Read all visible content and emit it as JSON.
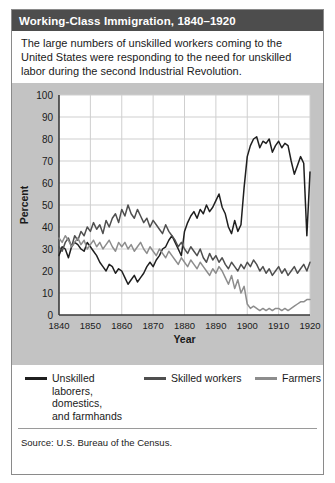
{
  "figure": {
    "title": "Working-Class Immigration, 1840–1920",
    "caption": "The large numbers of unskilled workers coming to the United States were responding to the need for unskilled labor during the second Industrial Revolution.",
    "source": "Source: U.S. Bureau of the Census."
  },
  "colors": {
    "title_bar": "#4d4d4d",
    "title_text": "#ffffff",
    "panel_background": "#c3c3c3",
    "plot_background": "#ffffff",
    "gridline": "#cfcfcf",
    "axis": "#3a3a3a",
    "series_unskilled": "#1f1f1f",
    "series_skilled": "#4f4f4f",
    "series_farmers": "#8d8d8d"
  },
  "chart_data": {
    "type": "line",
    "title": "",
    "xlabel": "Year",
    "ylabel": "Percent",
    "xlim": [
      1840,
      1920
    ],
    "ylim": [
      0,
      100
    ],
    "xticks": [
      1840,
      1850,
      1860,
      1870,
      1880,
      1890,
      1900,
      1910,
      1920
    ],
    "yticks": [
      0,
      10,
      20,
      30,
      40,
      50,
      60,
      70,
      80,
      90,
      100
    ],
    "grid": true,
    "legend_position": "below",
    "x": [
      1840,
      1841,
      1842,
      1843,
      1844,
      1845,
      1846,
      1847,
      1848,
      1849,
      1850,
      1851,
      1852,
      1853,
      1854,
      1855,
      1856,
      1857,
      1858,
      1859,
      1860,
      1861,
      1862,
      1863,
      1864,
      1865,
      1866,
      1867,
      1868,
      1869,
      1870,
      1871,
      1872,
      1873,
      1874,
      1875,
      1876,
      1877,
      1878,
      1879,
      1880,
      1881,
      1882,
      1883,
      1884,
      1885,
      1886,
      1887,
      1888,
      1889,
      1890,
      1891,
      1892,
      1893,
      1894,
      1895,
      1896,
      1897,
      1898,
      1899,
      1900,
      1901,
      1902,
      1903,
      1904,
      1905,
      1906,
      1907,
      1908,
      1909,
      1910,
      1911,
      1912,
      1913,
      1914,
      1915,
      1916,
      1917,
      1918,
      1919,
      1920
    ],
    "series": [
      {
        "name": "Unskilled laborers, domestics, and farmhands",
        "color": "#1f1f1f",
        "values": [
          27,
          31,
          30,
          26,
          31,
          33,
          32,
          30,
          29,
          33,
          31,
          29,
          27,
          24,
          22,
          20,
          23,
          22,
          19,
          21,
          20,
          17,
          14,
          16,
          18,
          15,
          17,
          19,
          22,
          24,
          22,
          25,
          27,
          30,
          31,
          34,
          36,
          33,
          30,
          27,
          38,
          42,
          45,
          47,
          44,
          48,
          46,
          50,
          47,
          49,
          52,
          55,
          49,
          46,
          40,
          37,
          43,
          38,
          41,
          58,
          72,
          77,
          80,
          81,
          76,
          79,
          78,
          80,
          74,
          77,
          79,
          76,
          78,
          77,
          70,
          64,
          68,
          72,
          69,
          36,
          65
        ]
      },
      {
        "name": "Skilled workers",
        "color": "#4f4f4f",
        "values": [
          31,
          29,
          33,
          35,
          31,
          36,
          34,
          38,
          36,
          40,
          38,
          42,
          39,
          41,
          37,
          43,
          40,
          44,
          46,
          42,
          48,
          45,
          50,
          46,
          44,
          48,
          45,
          42,
          44,
          40,
          43,
          41,
          39,
          37,
          41,
          38,
          36,
          34,
          31,
          33,
          30,
          28,
          31,
          29,
          27,
          30,
          26,
          24,
          28,
          25,
          27,
          24,
          26,
          23,
          21,
          24,
          22,
          20,
          23,
          21,
          24,
          22,
          25,
          23,
          20,
          22,
          19,
          21,
          18,
          20,
          22,
          19,
          21,
          18,
          20,
          22,
          19,
          21,
          23,
          20,
          24
        ]
      },
      {
        "name": "Farmers",
        "color": "#8d8d8d",
        "values": [
          35,
          33,
          36,
          34,
          31,
          33,
          35,
          32,
          34,
          30,
          32,
          34,
          31,
          33,
          30,
          32,
          34,
          31,
          29,
          33,
          31,
          33,
          30,
          32,
          29,
          31,
          33,
          30,
          28,
          31,
          29,
          27,
          30,
          28,
          26,
          29,
          27,
          25,
          23,
          26,
          24,
          22,
          25,
          23,
          21,
          24,
          22,
          20,
          18,
          21,
          19,
          22,
          20,
          17,
          14,
          18,
          12,
          16,
          10,
          13,
          5,
          3,
          4,
          3,
          2,
          3,
          2,
          3,
          2,
          3,
          3,
          2,
          3,
          2,
          3,
          4,
          5,
          6,
          6,
          7,
          7
        ]
      }
    ]
  },
  "legend": [
    {
      "label": "Unskilled\nlaborers,\ndomestics,\nand farmhands",
      "color": "#1f1f1f"
    },
    {
      "label": "Skilled workers",
      "color": "#4f4f4f"
    },
    {
      "label": "Farmers",
      "color": "#8d8d8d"
    }
  ]
}
